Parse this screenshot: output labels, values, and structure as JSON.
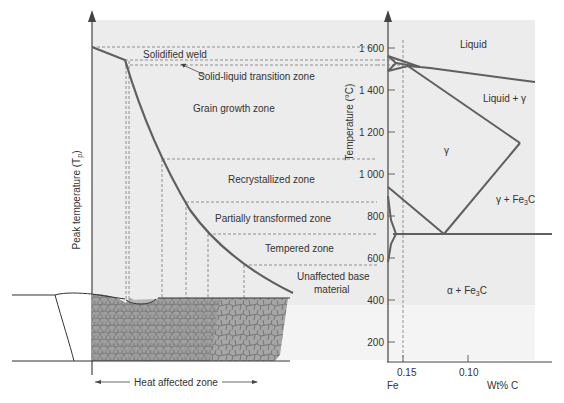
{
  "diagram": {
    "type": "weld-heat-affected-zone-vs-iron-carbon-phase-diagram",
    "colors": {
      "plot_background": "#ececec",
      "curve": "#5f5f5f",
      "axis": "#444444",
      "dashed": "#7a7a7a",
      "weld_fill": "#a8a8a8",
      "text": "#333333"
    },
    "left_panel": {
      "y_axis_label": "Peak temperature (T",
      "y_axis_label_sub": "p",
      "y_axis_label_close": ")",
      "zones": [
        {
          "id": "solidified-weld",
          "label": "Solidified weld"
        },
        {
          "id": "solid-liquid",
          "label": "Solid-liquid transition zone"
        },
        {
          "id": "grain-growth",
          "label": "Grain growth zone"
        },
        {
          "id": "recrystallized",
          "label": "Recrystallized zone"
        },
        {
          "id": "partially-transformed",
          "label": "Partially transformed zone"
        },
        {
          "id": "tempered",
          "label": "Tempered zone"
        },
        {
          "id": "unaffected-1",
          "label": "Unaffected base"
        },
        {
          "id": "unaffected-2",
          "label": "material"
        }
      ],
      "haz_label": "Heat affected zone"
    },
    "right_panel": {
      "y_axis_label": "Temperature (°C)",
      "y_ticks": [
        "1 600",
        "1 400",
        "1 200",
        "1 000",
        "800",
        "600",
        "400",
        "200"
      ],
      "x_ticks": [
        "0.15",
        "0.10"
      ],
      "x_origin_label": "Fe",
      "x_axis_label": "Wt% C",
      "regions": {
        "liquid": "Liquid",
        "liquid_gamma": "Liquid + γ",
        "gamma": "γ",
        "gamma_fe3c": "γ + Fe",
        "gamma_fe3c_sub": "3",
        "gamma_fe3c_end": "C",
        "alpha_fe3c": "α + Fe",
        "alpha_fe3c_sub": "3",
        "alpha_fe3c_end": "C"
      }
    }
  }
}
